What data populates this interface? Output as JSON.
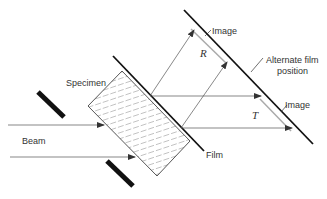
{
  "diagram": {
    "labels": {
      "specimen": "Specimen",
      "beam": "Beam",
      "film": "Film",
      "image_top": "Image",
      "image_bottom": "Image",
      "alternate_line1": "Alternate film",
      "alternate_line2": "position",
      "reflected": "R",
      "transmitted": "T"
    },
    "colors": {
      "line": "#222222",
      "thin_line": "#555555",
      "hatch": "#888888",
      "background": "#ffffff"
    }
  }
}
